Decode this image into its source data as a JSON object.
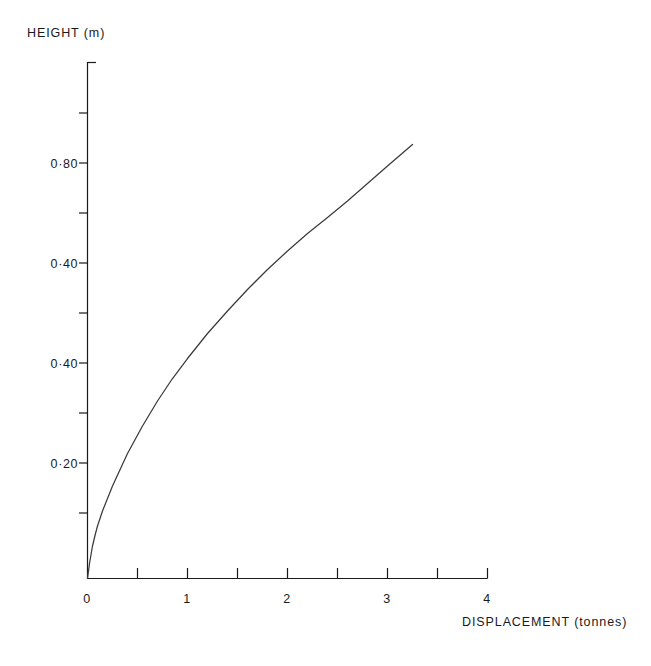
{
  "chart_data": {
    "type": "line",
    "title": "",
    "xlabel": "DISPLACEMENT (tonnes)",
    "ylabel": "HEIGHT (m)",
    "xlim": [
      0,
      4
    ],
    "ylim": [
      0,
      1.0
    ],
    "grid": false,
    "legend": null,
    "x_major_ticks": [
      0,
      1,
      2,
      3,
      4
    ],
    "x_major_tick_labels": [
      "0",
      "1",
      "2",
      "3",
      "4"
    ],
    "x_minor_ticks": [
      0.5,
      1.5,
      2.5,
      3.5
    ],
    "y_labeled_ticks": [
      0.8,
      0.6,
      0.4,
      0.2
    ],
    "y_tick_labels": [
      "0·80",
      "0·40",
      "0·40",
      "0·20"
    ],
    "y_minor_ticks": [
      0.1,
      0.3,
      0.5,
      0.7,
      0.9
    ],
    "series": [
      {
        "name": "load-displacement curve",
        "x": [
          0,
          0.02,
          0.05,
          0.08,
          0.1,
          0.15,
          0.25,
          0.4,
          0.55,
          0.7,
          0.85,
          1.0,
          1.2,
          1.4,
          1.6,
          1.8,
          2.0,
          2.2,
          2.4,
          2.6,
          2.8,
          3.0,
          3.25
        ],
        "y": [
          0,
          0.03,
          0.065,
          0.09,
          0.105,
          0.135,
          0.185,
          0.25,
          0.305,
          0.355,
          0.4,
          0.44,
          0.49,
          0.535,
          0.578,
          0.618,
          0.655,
          0.69,
          0.722,
          0.755,
          0.79,
          0.825,
          0.868
        ]
      }
    ]
  },
  "axes": {
    "y_title": "HEIGHT (m)",
    "x_title": "DISPLACEMENT (tonnes)"
  },
  "colors": {
    "ink": "#1a1a1a",
    "curve": "#3a3a3a",
    "background": "#ffffff"
  }
}
